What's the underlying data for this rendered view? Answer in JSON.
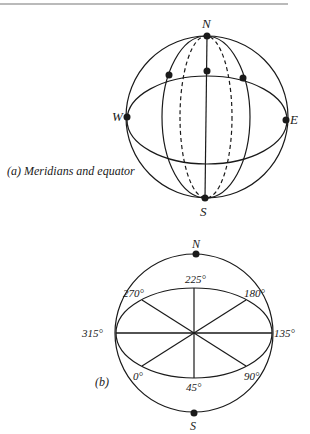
{
  "figure_a": {
    "caption": "(a) Meridians and equator",
    "labels": {
      "north": "N",
      "south": "S",
      "west": "W",
      "east": "E"
    }
  },
  "figure_b": {
    "caption": "(b)",
    "labels": {
      "north": "N",
      "south": "S",
      "angles": [
        "0°",
        "45°",
        "90°",
        "135°",
        "180°",
        "225°",
        "270°",
        "315°"
      ]
    }
  },
  "colors": {
    "ink": "#1a1a1a",
    "background": "#ffffff"
  }
}
